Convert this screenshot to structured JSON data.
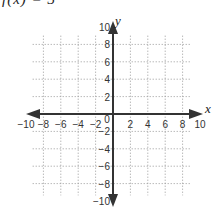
{
  "title": "f(x) = 3",
  "chart_data": {
    "type": "scatter",
    "title": "f(x) = 3",
    "xlabel": "x",
    "ylabel": "y",
    "xlim": [
      -10,
      10
    ],
    "ylim": [
      -10,
      10
    ],
    "grid": true,
    "x_ticks": [
      "−10",
      "−8",
      "−6",
      "−4",
      "−2",
      "0",
      "2",
      "4",
      "6",
      "8",
      "10"
    ],
    "y_ticks": [
      "10",
      "8",
      "6",
      "4",
      "2",
      "−2",
      "−4",
      "−6",
      "−8",
      "−10"
    ],
    "series": []
  },
  "axes": {
    "x_label": "x",
    "y_label": "y"
  }
}
